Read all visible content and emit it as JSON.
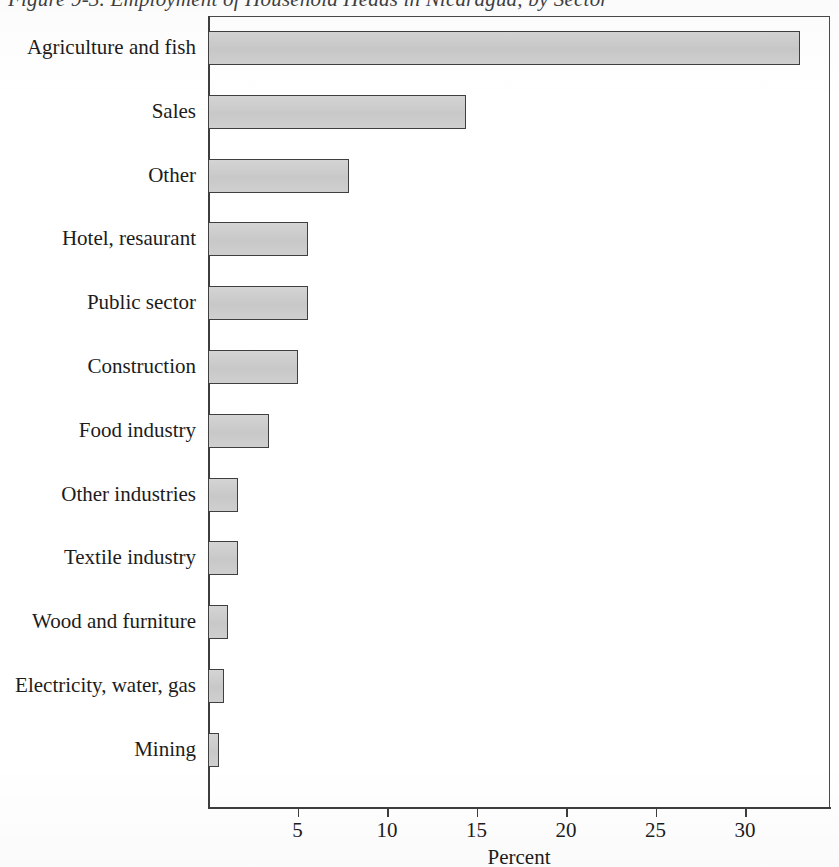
{
  "figure": {
    "title": "Figure 9-3. Employment of Household Heads in Nicaragua, by Sector"
  },
  "chart_data": {
    "type": "bar",
    "orientation": "horizontal",
    "title": "Figure 9-3. Employment of Household Heads in Nicaragua, by Sector",
    "xlabel": "Percent",
    "ylabel": "",
    "xlim": [
      0,
      34.8
    ],
    "ylim": null,
    "grid": false,
    "legend": null,
    "xticks": [
      5,
      10,
      15,
      20,
      25,
      30
    ],
    "xtick_labels": [
      "5",
      "10",
      "15",
      "20",
      "25",
      "30"
    ],
    "categories": [
      "Agriculture and fish",
      "Sales",
      "Other",
      "Hotel, resaurant",
      "Public sector",
      "Construction",
      "Food industry",
      "Other industries",
      "Textile industry",
      "Wood and furniture",
      "Electricity, water, gas",
      "Mining"
    ],
    "values": [
      33.1,
      14.4,
      7.9,
      5.6,
      5.6,
      5.0,
      3.4,
      1.7,
      1.7,
      1.1,
      0.9,
      0.6
    ],
    "bar_fill_color": "#cdcdcd",
    "bar_edge_color": "#3f3f3f",
    "background_color": "#ffffff"
  }
}
